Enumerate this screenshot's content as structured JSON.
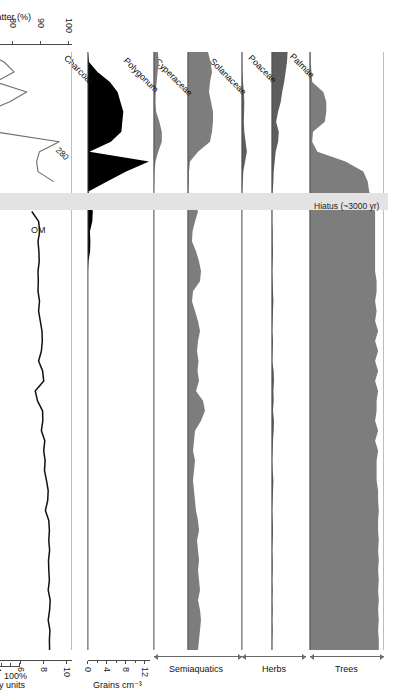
{
  "figure": {
    "citation": "(Mann et al., 2008)",
    "hiatus_label": "Hiatus (~3000 yr)",
    "percent_scale_label": "100%",
    "percent_scale_zero": "0"
  },
  "depth_axis": {
    "title_line1": "Depth",
    "title_line2": "(cm)",
    "ticks": [
      0,
      10,
      20,
      30,
      40,
      50,
      60
    ],
    "min": 0,
    "max": 60
  },
  "age_axis": {
    "title": "Cal yr BP",
    "dates": [
      {
        "label": "1180–1280 CE",
        "depth": 14.6
      },
      {
        "label": "4090–4410 BP",
        "depth": 16.4
      },
      {
        "label": "3990–4400 BP",
        "depth": 18.6
      },
      {
        "label": "4730–5210 BP",
        "depth": 33.8
      }
    ]
  },
  "hiatus": {
    "depth_start": 14.1,
    "depth_end": 15.9
  },
  "groups": [
    {
      "label": "Trees",
      "taxa": [
        "Palmae"
      ]
    },
    {
      "label": "Herbs",
      "taxa": [
        "Poaceae",
        "Solanaceae"
      ]
    },
    {
      "label": "Semiaquatics",
      "taxa": [
        "Cyperaceae",
        "Polygonum"
      ]
    }
  ],
  "panels": [
    {
      "name": "Palmae",
      "taxon": "Palmae",
      "group": "Trees",
      "fill": "#7d7d7d",
      "scale_max": 100,
      "units": "%"
    },
    {
      "name": "Poaceae",
      "taxon": "Poaceae",
      "group": "Herbs",
      "fill": "#5e5e5e",
      "scale_max": 100,
      "units": "%"
    },
    {
      "name": "Solanaceae",
      "taxon": "Solanaceae",
      "group": "Herbs",
      "fill": "#5e5e5e",
      "scale_max": 100,
      "units": "%"
    },
    {
      "name": "Cyperaceae",
      "taxon": "Cyperaceae",
      "group": "Semiaquatics",
      "fill": "#7d7d7d",
      "scale_max": 100,
      "units": "%"
    },
    {
      "name": "Polygonum",
      "taxon": "Polygonum",
      "group": "Semiaquatics",
      "fill": "#7d7d7d",
      "scale_max": 100,
      "units": "%"
    },
    {
      "name": "Charcoal",
      "taxon": "Charcoal",
      "group": "",
      "fill": "#000000",
      "scale_max": 13,
      "units": "Grains cm⁻³"
    }
  ],
  "charcoal_axis": {
    "title": "Grains cm⁻³",
    "ticks": [
      0,
      4,
      8,
      12
    ],
    "minor_ticks": [
      2,
      6,
      10
    ],
    "min": 0,
    "max": 13
  },
  "om_axis": {
    "title": "Organic matter (%)",
    "ticks": [
      50,
      60,
      70,
      80,
      90,
      100
    ],
    "min": 48,
    "max": 101
  },
  "ms_axis": {
    "title": "Susceptibility units",
    "ticks": [
      -2,
      0,
      2,
      4,
      6,
      8,
      10
    ],
    "min": -2.6,
    "max": 10.4
  },
  "series_labels": {
    "om": "OM",
    "ms": "MS",
    "spike_annotation": "280"
  },
  "colors": {
    "om_line": "#111111",
    "ms_line": "#7a7a7a",
    "charcoal_fill": "#000000",
    "pollen_fill": "#7d7d7d",
    "pollen_fill_dark": "#5e5e5e",
    "hiatus_band": "#e3e3e3",
    "axis": "#4a4a4a",
    "rule": "#bdbdbd"
  },
  "chart_data": {
    "type": "area",
    "xlabel": "Depth (cm)",
    "xlim": [
      0,
      60
    ],
    "grid": false,
    "legend": "none",
    "depths": [
      0,
      1,
      2,
      3,
      4,
      5,
      6,
      7,
      8,
      9,
      10,
      11,
      12,
      13,
      14,
      16,
      17,
      18,
      19,
      20,
      21,
      22,
      23,
      24,
      25,
      26,
      27,
      28,
      29,
      30,
      31,
      32,
      33,
      34,
      35,
      36,
      37,
      38,
      39,
      40,
      41,
      42,
      43,
      44,
      45,
      46,
      47,
      48,
      49,
      50,
      51,
      52,
      53,
      54,
      55,
      56,
      57,
      58,
      59,
      60
    ],
    "series": [
      {
        "name": "Palmae",
        "ylabel": "%",
        "ylim": [
          0,
          100
        ],
        "values": [
          1,
          1,
          2,
          3,
          18,
          22,
          22,
          20,
          4,
          3,
          10,
          48,
          72,
          78,
          80,
          88,
          88,
          88,
          88,
          88,
          88,
          88,
          90,
          90,
          88,
          90,
          88,
          92,
          88,
          92,
          88,
          92,
          88,
          92,
          90,
          90,
          88,
          92,
          88,
          92,
          90,
          90,
          90,
          92,
          92,
          93,
          92,
          92,
          93,
          92,
          93,
          92,
          93,
          92,
          93,
          92,
          93,
          92,
          93,
          93
        ]
      },
      {
        "name": "Poaceae",
        "ylabel": "%",
        "ylim": [
          0,
          100
        ],
        "values": [
          46,
          44,
          40,
          36,
          30,
          26,
          18,
          12,
          20,
          18,
          11,
          8,
          5,
          4,
          2,
          1,
          1,
          2,
          2,
          3,
          2,
          1,
          2,
          3,
          4,
          3,
          2,
          1,
          3,
          2,
          1,
          5,
          6,
          4,
          5,
          3,
          6,
          5,
          3,
          2,
          1,
          2,
          4,
          3,
          2,
          1,
          2,
          3,
          2,
          1,
          2,
          2,
          1,
          2,
          1,
          2,
          1,
          2,
          1,
          1
        ]
      },
      {
        "name": "Solanaceae",
        "ylabel": "%",
        "ylim": [
          0,
          100
        ],
        "values": [
          1,
          1,
          2,
          4,
          7,
          9,
          8,
          7,
          9,
          14,
          19,
          12,
          5,
          3,
          1,
          0,
          0,
          0,
          0,
          0,
          0,
          0,
          0,
          0,
          0,
          0,
          0,
          0,
          0,
          0,
          0,
          0,
          0,
          0,
          0,
          0,
          0,
          0,
          0,
          0,
          0,
          0,
          0,
          0,
          0,
          0,
          0,
          0,
          0,
          0,
          0,
          0,
          0,
          0,
          0,
          0,
          0,
          0,
          0,
          0
        ]
      },
      {
        "name": "Cyperaceae",
        "ylabel": "%",
        "ylim": [
          0,
          100
        ],
        "values": [
          40,
          45,
          48,
          44,
          42,
          46,
          50,
          50,
          48,
          44,
          20,
          4,
          2,
          2,
          1,
          20,
          14,
          9,
          8,
          16,
          22,
          26,
          24,
          10,
          8,
          14,
          20,
          24,
          20,
          18,
          21,
          19,
          22,
          16,
          30,
          34,
          26,
          14,
          12,
          10,
          14,
          12,
          10,
          12,
          14,
          16,
          20,
          22,
          18,
          20,
          22,
          20,
          22,
          24,
          20,
          24,
          26,
          24,
          22,
          20
        ]
      },
      {
        "name": "Polygonum",
        "ylabel": "%",
        "ylim": [
          0,
          100
        ],
        "values": [
          13,
          16,
          12,
          9,
          6,
          5,
          7,
          18,
          26,
          26,
          14,
          5,
          2,
          1,
          0,
          0,
          0,
          0,
          0,
          0,
          0,
          0,
          0,
          0,
          0,
          0,
          0,
          0,
          0,
          0,
          0,
          0,
          0,
          0,
          0,
          0,
          0,
          0,
          0,
          0,
          0,
          0,
          0,
          0,
          0,
          0,
          0,
          0,
          0,
          0,
          0,
          0,
          0,
          0,
          0,
          0,
          0,
          0,
          0,
          0
        ]
      },
      {
        "name": "Charcoal",
        "ylabel": "Grains cm⁻³",
        "ylim": [
          0,
          13
        ],
        "values": [
          0,
          0.2,
          2.0,
          4.6,
          6.2,
          6.8,
          7.4,
          7.2,
          7.0,
          4.8,
          0.3,
          12.8,
          8.0,
          4.0,
          0.1,
          1.0,
          0.9,
          0.4,
          0.5,
          0.45,
          0.1,
          0,
          0,
          0,
          0,
          0,
          0,
          0,
          0,
          0,
          0,
          0,
          0,
          0,
          0,
          0,
          0,
          0,
          0,
          0,
          0,
          0,
          0,
          0,
          0,
          0,
          0,
          0,
          0,
          0,
          0,
          0,
          0,
          0,
          0,
          0,
          0,
          0,
          0,
          0
        ]
      },
      {
        "name": "OM",
        "ylabel": "Organic matter (%)",
        "ylim": [
          48,
          101
        ],
        "values": [
          63.5,
          63.2,
          69.5,
          70.8,
          71.0,
          72.5,
          72.2,
          71.0,
          67.5,
          69.0,
          69.2,
          73.0,
          73.2,
          71.5,
          71.8,
          68.0,
          76.5,
          74.5,
          70.0,
          58.5,
          71.0,
          66.5,
          null,
          null,
          null,
          null,
          null,
          null,
          null,
          null,
          null,
          null,
          null,
          null,
          null,
          null,
          null,
          null,
          null,
          null,
          null,
          null,
          null,
          null,
          null,
          null,
          null,
          null,
          null,
          null,
          null,
          null,
          null,
          null,
          null,
          null,
          null,
          null,
          null,
          null
        ]
      },
      {
        "name": "MS",
        "ylabel": "Susceptibility units",
        "ylim": [
          -2.6,
          10.4
        ],
        "values": [
          70.5,
          77.0,
          80.5,
          74.0,
          85.0,
          79.0,
          70.5,
          71.5,
          73.5,
          96.5,
          89.5,
          88.5,
          89.0,
          94.5,
          null,
          null,
          null,
          null,
          null,
          null,
          null,
          null,
          null,
          null,
          null,
          null,
          null,
          null,
          null,
          null,
          null,
          null,
          null,
          null,
          null,
          null,
          null,
          null,
          null,
          null,
          null,
          null,
          null,
          null,
          null,
          null,
          null,
          null,
          null,
          null,
          null,
          null,
          null,
          null,
          null,
          null,
          null,
          null,
          null,
          null
        ]
      }
    ],
    "om_lower": {
      "name": "OM lower core",
      "depths": [
        16,
        17,
        18,
        19,
        20,
        21,
        22,
        23,
        24,
        25,
        26,
        27,
        28,
        29,
        30,
        31,
        32,
        33,
        34,
        35,
        36,
        37,
        38,
        39,
        40,
        41,
        42,
        43,
        44,
        45,
        46,
        47,
        48,
        49,
        50,
        51,
        52,
        53,
        54,
        55,
        56,
        57,
        58,
        59,
        60
      ],
      "values": [
        86.8,
        89.2,
        89.6,
        89.0,
        89.3,
        89.4,
        89.0,
        89.1,
        89.0,
        89.5,
        89.2,
        89.8,
        90.4,
        90.5,
        90.2,
        89.2,
        90.6,
        91.0,
        88.0,
        88.8,
        90.6,
        90.7,
        90.2,
        91.4,
        91.0,
        91.5,
        91.3,
        92.0,
        92.6,
        92.4,
        91.6,
        92.8,
        93.0,
        92.8,
        93.1,
        92.7,
        92.8,
        93.0,
        92.6,
        93.3,
        93.1,
        92.6,
        93.2,
        93.0,
        93.1
      ]
    },
    "ms_lower": {
      "name": "MS lower core",
      "depths": [
        16,
        17,
        18,
        19,
        20,
        21,
        22,
        23,
        24,
        25,
        26,
        27,
        28,
        29,
        30,
        31,
        32,
        33,
        34,
        35,
        36,
        37,
        38,
        39,
        40,
        41,
        42,
        43,
        44,
        45,
        46,
        47,
        48,
        49,
        50,
        51,
        52,
        53,
        54,
        55,
        56,
        57,
        58,
        59,
        60
      ],
      "values": [
        1.45,
        1.5,
        1.2,
        1.45,
        1.3,
        1.1,
        1.25,
        0.95,
        0.9,
        1.0,
        0.6,
        -0.05,
        -0.05,
        0.55,
        0.05,
        -0.1,
        -0.15,
        -0.1,
        0.1,
        0.45,
        0.25,
        0.05,
        -0.2,
        -0.3,
        -0.1,
        -0.35,
        -0.25,
        -0.45,
        -0.3,
        -1.05,
        -1.7,
        -0.9,
        -0.7,
        -0.8,
        -0.75,
        -0.85,
        -0.7,
        -0.85,
        -0.9,
        -0.95,
        -0.85,
        -0.8,
        -0.6,
        0.05,
        -0.55
      ]
    },
    "spike": {
      "label": "280",
      "depth": 9,
      "value": 96.5
    }
  }
}
